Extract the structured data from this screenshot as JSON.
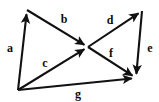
{
  "diagram": {
    "type": "directed-vector-graph",
    "background_color": "#ffffff",
    "stroke_color": "#111111",
    "label_color": "#0d0d0d",
    "nodes": [
      {
        "id": "top-left",
        "name": "top-left-vertex",
        "x": 27,
        "y": 10
      },
      {
        "id": "bottom-left",
        "name": "bottom-left-vertex",
        "x": 18,
        "y": 90
      },
      {
        "id": "center",
        "name": "center-crossing",
        "x": 88,
        "y": 47
      },
      {
        "id": "top-right",
        "name": "top-right-vertex",
        "x": 142,
        "y": 11
      },
      {
        "id": "bottom-right",
        "name": "bottom-right-vertex",
        "x": 136,
        "y": 78
      }
    ],
    "edges": [
      {
        "id": "a",
        "label": "a",
        "from": "bottom-left",
        "to": "top-left",
        "arrow_at": "to",
        "label_x": 10,
        "label_y": 48
      },
      {
        "id": "b",
        "label": "b",
        "from": "top-left",
        "to": "center",
        "arrow_at": "to",
        "label_x": 64,
        "label_y": 19
      },
      {
        "id": "c",
        "label": "c",
        "from": "bottom-left",
        "to": "center",
        "arrow_at": "to",
        "label_x": 45,
        "label_y": 63
      },
      {
        "id": "d",
        "label": "d",
        "from": "center",
        "to": "top-right",
        "arrow_at": "to",
        "label_x": 110,
        "label_y": 20
      },
      {
        "id": "e",
        "label": "e",
        "from": "top-right",
        "to": "bottom-right",
        "arrow_at": "to",
        "label_x": 150,
        "label_y": 48
      },
      {
        "id": "f",
        "label": "f",
        "from": "center",
        "to": "bottom-right",
        "arrow_at": "to",
        "label_x": 111,
        "label_y": 53
      },
      {
        "id": "g",
        "label": "g",
        "from": "bottom-left",
        "to": "bottom-right",
        "arrow_at": "to",
        "label_x": 78,
        "label_y": 94
      }
    ]
  }
}
